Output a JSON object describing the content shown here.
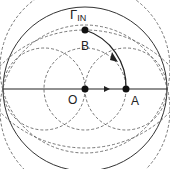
{
  "diagram": {
    "type": "smith-chart-path",
    "title_symbol": "Γ",
    "title_subscript": "IN",
    "points": [
      {
        "id": "O",
        "label": "O",
        "x": 85,
        "y": 89
      },
      {
        "id": "A",
        "label": "A",
        "x": 126,
        "y": 89
      },
      {
        "id": "B",
        "label": "B",
        "x": 85,
        "y": 30
      }
    ],
    "paths": [
      {
        "from": "O",
        "to": "A",
        "style": "solid",
        "arrow": true
      },
      {
        "from": "A",
        "to": "B",
        "style": "solid-arc",
        "arrow": true
      }
    ],
    "colors": {
      "stroke": "#222222",
      "dashed": "#555555",
      "background": "#ffffff"
    }
  }
}
